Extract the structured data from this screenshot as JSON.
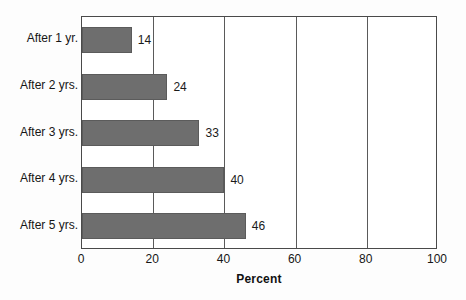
{
  "chart_data": {
    "type": "bar",
    "orientation": "horizontal",
    "title": "",
    "subtitle": "",
    "xlabel": "Percent",
    "ylabel": "",
    "categories": [
      "After 1 yr.",
      "After 2 yrs.",
      "After 3 yrs.",
      "After 4 yrs.",
      "After 5 yrs."
    ],
    "values": [
      14,
      24,
      33,
      40,
      46
    ],
    "data_labels": [
      "14",
      "24",
      "33",
      "40",
      "46"
    ],
    "xlim": [
      0,
      100
    ],
    "xticks": [
      0,
      20,
      40,
      60,
      80,
      100
    ],
    "xtick_labels": [
      "0",
      "20",
      "40",
      "60",
      "80",
      "100"
    ],
    "gridlines": [
      20,
      40,
      60,
      80
    ],
    "grid": true,
    "legend": null,
    "legend_position": "none",
    "bar_color": "#6e6e6e",
    "bar_edge_color": "#5b5b5b",
    "axis_color": "#4a4a4a",
    "grid_color": "#5a5a5a",
    "plot_background": "#ffffff",
    "page_background": "#fdfdfd",
    "text_color": "#161616"
  }
}
